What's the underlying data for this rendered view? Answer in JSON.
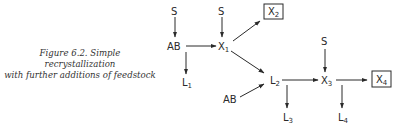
{
  "caption": {
    "line1": "Figure 6.2.  Simple recrystallization",
    "line2": "with further additions of feedstock"
  },
  "nodes": {
    "s1": {
      "label": "S"
    },
    "ab1": {
      "label": "AB"
    },
    "l1": {
      "label": "L",
      "sub": "1"
    },
    "s2": {
      "label": "S"
    },
    "x1": {
      "label": "X",
      "sub": "1"
    },
    "x2": {
      "label": "X",
      "sub": "2",
      "boxed": true
    },
    "l2": {
      "label": "L",
      "sub": "2"
    },
    "ab2": {
      "label": "AB"
    },
    "l3": {
      "label": "L",
      "sub": "3"
    },
    "s3": {
      "label": "S"
    },
    "x3": {
      "label": "X",
      "sub": "3"
    },
    "l4": {
      "label": "L",
      "sub": "4"
    },
    "x4": {
      "label": "X",
      "sub": "4",
      "boxed": true
    }
  },
  "edges": [
    [
      "S",
      "AB"
    ],
    [
      "AB",
      "L1"
    ],
    [
      "AB",
      "X1"
    ],
    [
      "S",
      "X1"
    ],
    [
      "X1",
      "X2"
    ],
    [
      "X1",
      "L2"
    ],
    [
      "AB",
      "L2"
    ],
    [
      "L2",
      "L3"
    ],
    [
      "L2",
      "X3"
    ],
    [
      "S",
      "X3"
    ],
    [
      "X3",
      "L4"
    ],
    [
      "X3",
      "X4"
    ]
  ]
}
